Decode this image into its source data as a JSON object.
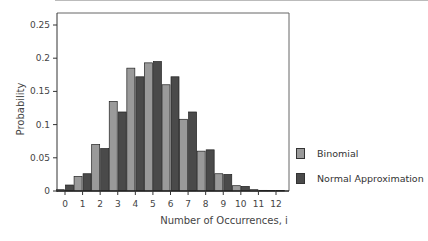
{
  "chart_data": {
    "type": "bar",
    "title": "",
    "xlabel": "Number of Occurrences, i",
    "ylabel": "Probability",
    "categories": [
      "0",
      "1",
      "2",
      "3",
      "4",
      "5",
      "6",
      "7",
      "8",
      "9",
      "10",
      "11",
      "12"
    ],
    "series": [
      {
        "name": "Binomial",
        "color": "#9a9a9a",
        "values": [
          0.002,
          0.022,
          0.07,
          0.135,
          0.185,
          0.193,
          0.16,
          0.108,
          0.06,
          0.026,
          0.008,
          0.002,
          0.0005
        ]
      },
      {
        "name": "Normal Approximation",
        "color": "#4a4a4a",
        "values": [
          0.009,
          0.026,
          0.064,
          0.119,
          0.172,
          0.195,
          0.172,
          0.119,
          0.062,
          0.025,
          0.007,
          0.001,
          0.0003
        ]
      }
    ],
    "ylim": [
      0,
      0.27
    ],
    "yticks": [
      0,
      0.05,
      0.1,
      0.15,
      0.2,
      0.25
    ],
    "ytick_labels": [
      "0",
      "0.05",
      "0.1",
      "0.15",
      "0.2",
      "0.25"
    ],
    "grid": false,
    "legend_position": "right"
  },
  "legend": {
    "items": [
      {
        "label": "Binomial",
        "color": "#9a9a9a"
      },
      {
        "label": "Normal Approximation",
        "color": "#4a4a4a"
      }
    ]
  }
}
